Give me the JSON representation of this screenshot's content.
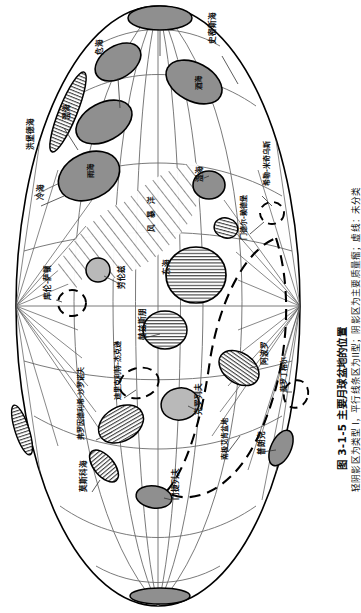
{
  "figure": {
    "caption_title": "图 3-1-5  主要月球盆地的位置",
    "caption_subtitle": "轻阴影区为类型 I，平行线条区为II型；阴影区为主要质量瘤；虚线：未分类"
  },
  "map": {
    "projection": "mollweide-like oval graticule",
    "outline_color": "#000000",
    "graticule_color": "#6b6b6b",
    "mascon_fill": "#8f8f8f",
    "type1_fill": "#b9b9b9",
    "type2_pattern": "horizontal-line-hatch",
    "unclassified_stroke": "dashed",
    "background": "#ffffff",
    "basins": [
      {
        "id": "humboldtianum",
        "label": "洪堡德海",
        "style": "hatch",
        "cx": 68,
        "cy": 112,
        "rx": 9,
        "ry": 43,
        "rot": 22,
        "label_x": 27,
        "label_y": 150
      },
      {
        "id": "crisium",
        "label": "危海",
        "style": "mascon",
        "cx": 118,
        "cy": 62,
        "rx": 25,
        "ry": 16,
        "rot": -32,
        "label_x": 96,
        "label_y": 55
      },
      {
        "id": "serenitatis",
        "label": "澄海",
        "style": "mascon",
        "cx": 104,
        "cy": 122,
        "rx": 30,
        "ry": 19,
        "rot": -28,
        "label_x": 63,
        "label_y": 120
      },
      {
        "id": "imbrium",
        "label": "雨海",
        "style": "mascon",
        "cx": 89,
        "cy": 176,
        "rx": 32,
        "ry": 23,
        "rot": -25,
        "label_x": 87,
        "label_y": 178
      },
      {
        "id": "frigoris",
        "label": "冷海",
        "style": "none",
        "cx": 0,
        "cy": 0,
        "rx": 0,
        "ry": 0,
        "rot": 0,
        "label_x": 37,
        "label_y": 200
      },
      {
        "id": "smythii",
        "label": "史密斯海",
        "style": "none",
        "cx": 0,
        "cy": 0,
        "rx": 0,
        "ry": 0,
        "rot": 0,
        "label_x": 209,
        "label_y": 44
      },
      {
        "id": "nectaris",
        "label": "酒海",
        "style": "mascon",
        "cx": 194,
        "cy": 82,
        "rx": 30,
        "ry": 19,
        "rot": 28,
        "label_x": 195,
        "label_y": 90
      },
      {
        "id": "humorum",
        "label": "湿海",
        "style": "mascon",
        "cx": 209,
        "cy": 185,
        "rx": 16,
        "ry": 14,
        "rot": 10,
        "label_x": 196,
        "label_y": 182
      },
      {
        "id": "mendel-rydberg",
        "label": "门德尔-赖德堡",
        "style": "dashed",
        "cx": 272,
        "cy": 213,
        "rx": 12,
        "ry": 11,
        "rot": 0,
        "label_x": 241,
        "label_y": 240
      },
      {
        "id": "schiller-zucchius",
        "label": "希勒-米奇乌斯",
        "style": "none",
        "cx": 0,
        "cy": 0,
        "rx": 0,
        "ry": 0,
        "rot": 0,
        "label_x": 264,
        "label_y": 186
      },
      {
        "id": "procellarum",
        "label": "风暴洋",
        "style": "hatch-field",
        "cx": 0,
        "cy": 0,
        "rx": 0,
        "ry": 0,
        "rot": 0,
        "label_x": 148,
        "label_y": 232
      },
      {
        "id": "lorentz",
        "label": "劳伦兹",
        "style": "type1",
        "cx": 98,
        "cy": 270,
        "rx": 12,
        "ry": 12,
        "rot": 0,
        "label_x": 118,
        "label_y": 289
      },
      {
        "id": "orientale",
        "label": "东海",
        "style": "hatch",
        "cx": 196,
        "cy": 275,
        "rx": 30,
        "ry": 28,
        "rot": 0,
        "label_x": 163,
        "label_y": 275
      },
      {
        "id": "coulomb-sarton",
        "label": "库伦-萨顿",
        "style": "dashed",
        "cx": 72,
        "cy": 303,
        "rx": 14,
        "ry": 13,
        "rot": 0,
        "label_x": 44,
        "label_y": 300
      },
      {
        "id": "hertzsprung",
        "label": "赫兹斯朋",
        "style": "hatch",
        "cx": 165,
        "cy": 330,
        "rx": 22,
        "ry": 19,
        "rot": 0,
        "label_x": 139,
        "label_y": 340
      },
      {
        "id": "dirichlet-jackson",
        "label": "迪里克利特-杰克逊",
        "style": "dashed",
        "cx": 139,
        "cy": 383,
        "rx": 20,
        "ry": 15,
        "rot": -15,
        "label_x": 115,
        "label_y": 400
      },
      {
        "id": "freundlich-sharonov",
        "label": "弗罗因德利希-沙罗诺夫",
        "style": "hatch",
        "cx": 121,
        "cy": 424,
        "rx": 24,
        "ry": 17,
        "rot": -30,
        "label_x": 78,
        "label_y": 440
      },
      {
        "id": "korolev",
        "label": "克罗列夫",
        "style": "type1",
        "cx": 180,
        "cy": 404,
        "rx": 19,
        "ry": 16,
        "rot": -10,
        "label_x": 195,
        "label_y": 415
      },
      {
        "id": "moscoviense",
        "label": "莫斯科海",
        "style": "hatch",
        "cx": 104,
        "cy": 466,
        "rx": 10,
        "ry": 19,
        "rot": -40,
        "label_x": 80,
        "label_y": 492
      },
      {
        "id": "mendeleev",
        "label": "门捷列夫",
        "style": "mascon",
        "cx": 154,
        "cy": 497,
        "rx": 18,
        "ry": 11,
        "rot": 8,
        "label_x": 172,
        "label_y": 500
      },
      {
        "id": "apollo",
        "label": "阿波罗",
        "style": "hatch",
        "cx": 239,
        "cy": 368,
        "rx": 22,
        "ry": 15,
        "rot": 35,
        "label_x": 261,
        "label_y": 365
      },
      {
        "id": "schrodinger",
        "label": "薛罗丁格尔",
        "style": "dashed",
        "cx": 296,
        "cy": 394,
        "rx": 12,
        "ry": 14,
        "rot": 20,
        "label_x": 281,
        "label_y": 392
      },
      {
        "id": "planck",
        "label": "普朗克",
        "style": "mascon",
        "cx": 281,
        "cy": 448,
        "rx": 10,
        "ry": 19,
        "rot": 25,
        "label_x": 258,
        "label_y": 455
      },
      {
        "id": "spa",
        "label": "南极艾肯盆地",
        "style": "dashed-big",
        "cx": 0,
        "cy": 0,
        "rx": 0,
        "ry": 0,
        "rot": 0,
        "label_x": 222,
        "label_y": 460
      },
      {
        "id": "top-mare",
        "label": "",
        "style": "mascon",
        "cx": 160,
        "cy": 18,
        "rx": 32,
        "ry": 12,
        "rot": 0,
        "label_x": 0,
        "label_y": 0
      },
      {
        "id": "bottom-mare",
        "label": "",
        "style": "mascon",
        "cx": 160,
        "cy": 596,
        "rx": 30,
        "ry": 8,
        "rot": 0,
        "label_x": 0,
        "label_y": 0
      }
    ]
  }
}
